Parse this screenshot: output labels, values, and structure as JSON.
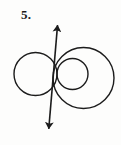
{
  "figure": {
    "label": "5.",
    "caption_number": "5",
    "stroke_color": "#1c1c1c",
    "fill_color": "none",
    "background_color": "#fdfdfc",
    "canvas": {
      "width": 121,
      "height": 145
    },
    "curves": [
      {
        "name": "left-circle",
        "type": "circle",
        "cx": 35.5,
        "cy": 74,
        "r": 21.5,
        "stroke_width": 1.4
      },
      {
        "name": "right-small-circle",
        "type": "circle",
        "cx": 72.5,
        "cy": 74,
        "r": 15.5,
        "stroke_width": 1.4
      },
      {
        "name": "right-large-circle",
        "type": "circle",
        "cx": 83.5,
        "cy": 78,
        "r": 30.5,
        "stroke_width": 1.4
      }
    ],
    "axis": {
      "name": "vertical-axis-arrow",
      "type": "double-headed-arrow",
      "x1": 57.8,
      "y1": 22,
      "x2": 48.5,
      "y2": 132,
      "stroke_width": 1.6,
      "arrowhead_length": 11,
      "arrowhead_width": 7
    },
    "tangency_point": {
      "x": 57,
      "y": 74
    }
  }
}
